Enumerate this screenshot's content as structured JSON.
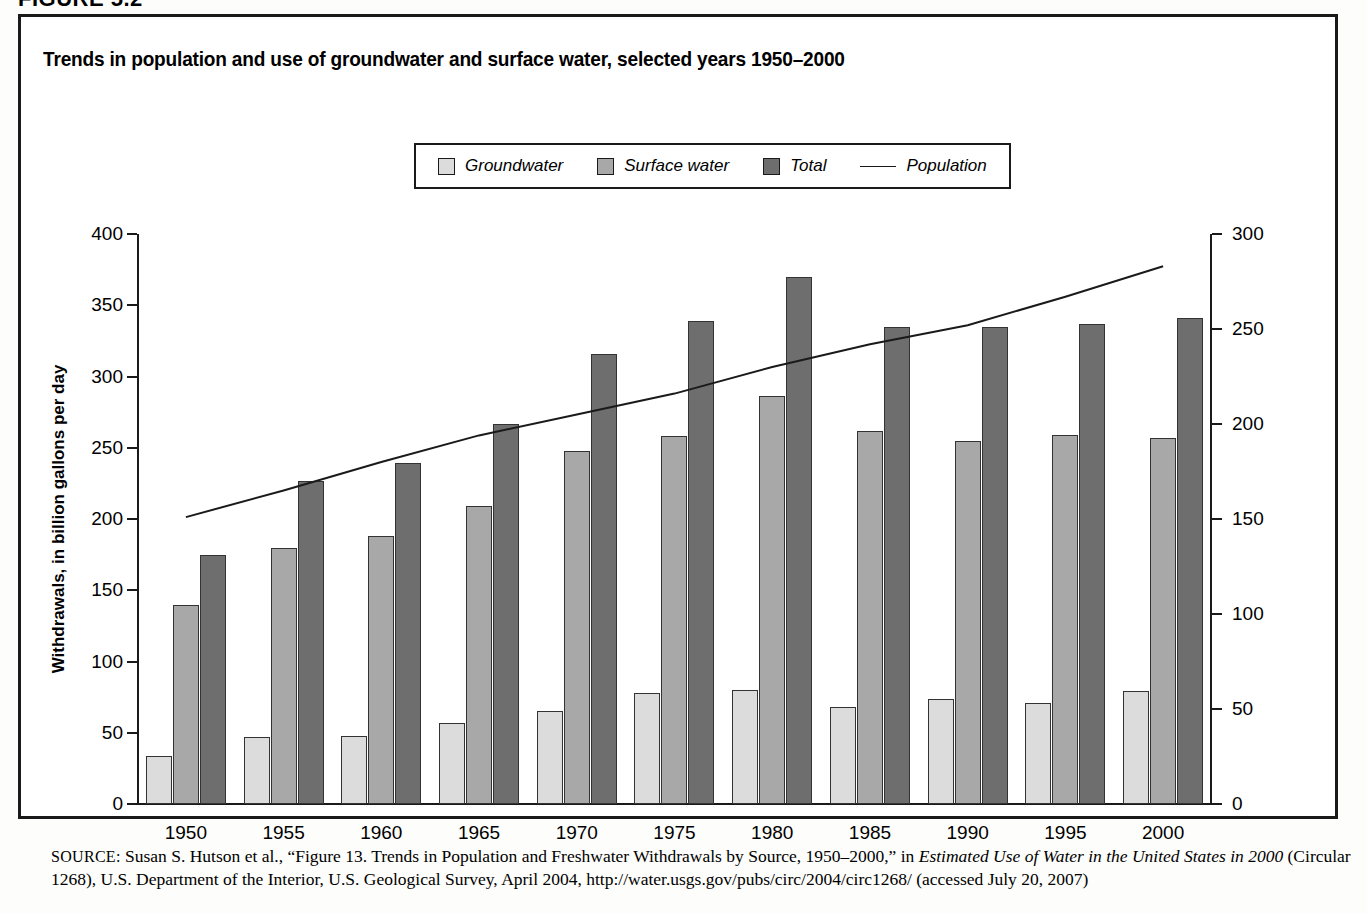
{
  "figure_label": "FIGURE 5.2",
  "chart_title": "Trends in population and use of groundwater and surface water, selected years 1950–2000",
  "legend": {
    "items": [
      {
        "label": "Groundwater",
        "marker": "swatch",
        "color": "#dcdcdc"
      },
      {
        "label": "Surface water",
        "marker": "swatch",
        "color": "#a8a8a8"
      },
      {
        "label": "Total",
        "marker": "swatch",
        "color": "#6e6e6e"
      },
      {
        "label": "Population",
        "marker": "line",
        "color": "#1a1a1a"
      }
    ]
  },
  "source": {
    "prefix": "SOURCE:",
    "text_1": " Susan S. Hutson et al., “Figure 13. Trends in Population and Freshwater Withdrawals by Source, 1950–2000,” in ",
    "italic_1": "Estimated Use of Water in the United States in 2000",
    "text_2": " (Circular 1268), U.S. Department of the Interior, U.S. Geological Survey, April 2004, http://water.usgs.gov/pubs/circ/2004/circ1268/ (accessed July 20, 2007)"
  },
  "chart_data": {
    "type": "bar",
    "title": "Trends in population and use of groundwater and surface water, selected years 1950–2000",
    "xlabel": "",
    "ylabel": "Withdrawals, in billion gallons per day",
    "y2label": "Population, in millions",
    "ylim": [
      0,
      400
    ],
    "y2lim": [
      0,
      300
    ],
    "yticks": [
      0,
      50,
      100,
      150,
      200,
      250,
      300,
      350,
      400
    ],
    "y2ticks": [
      0,
      50,
      100,
      150,
      200,
      250,
      300
    ],
    "grid": false,
    "legend_position": "top-center",
    "categories": [
      "1950",
      "1955",
      "1960",
      "1965",
      "1970",
      "1975",
      "1980",
      "1985",
      "1990",
      "1995",
      "2000"
    ],
    "series": [
      {
        "name": "Groundwater",
        "axis": "left",
        "type": "bar",
        "color": "#dcdcdc",
        "values": [
          34,
          47,
          48,
          57,
          65,
          78,
          80,
          68,
          74,
          71,
          79
        ]
      },
      {
        "name": "Surface water",
        "axis": "left",
        "type": "bar",
        "color": "#a8a8a8",
        "values": [
          140,
          180,
          188,
          209,
          248,
          258,
          286,
          262,
          255,
          259,
          257
        ]
      },
      {
        "name": "Total",
        "axis": "left",
        "type": "bar",
        "color": "#6e6e6e",
        "values": [
          175,
          227,
          239,
          267,
          316,
          339,
          370,
          335,
          335,
          337,
          341
        ]
      },
      {
        "name": "Population",
        "axis": "right",
        "type": "line",
        "color": "#1a1a1a",
        "values": [
          151,
          165,
          180,
          194,
          205,
          216,
          230,
          242,
          252,
          267,
          283
        ]
      }
    ]
  }
}
